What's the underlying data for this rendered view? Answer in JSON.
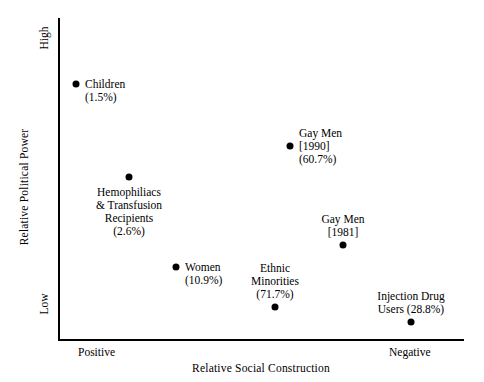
{
  "chart_data": {
    "type": "scatter",
    "title": "",
    "xlabel": "Relative Social Construction",
    "ylabel": "Relative Political Power",
    "x_ticks": [
      "Positive",
      "Negative"
    ],
    "y_ticks": [
      "High",
      "Low"
    ],
    "xlim": [
      "Positive",
      "Negative"
    ],
    "ylim": [
      "Low",
      "High"
    ],
    "grid": false,
    "legend": "none",
    "marker": "filled-circle",
    "marker_color": "#000000",
    "points": [
      {
        "name": "Children",
        "label_lines": [
          "Children",
          "(1.5%)"
        ],
        "percent": "1.5%",
        "x_px": 76,
        "y_px": 84,
        "x_norm": 0.044,
        "y_norm": 0.795,
        "label_align": "left"
      },
      {
        "name": "Hemophiliacs & Transfusion Recipients",
        "label_lines": [
          "Hemophiliacs",
          "& Transfusion",
          "Recipients",
          "(2.6%)"
        ],
        "percent": "2.6%",
        "x_px": 129,
        "y_px": 177,
        "x_norm": 0.175,
        "y_norm": 0.507,
        "label_align": "center"
      },
      {
        "name": "Gay Men [1990]",
        "label_lines": [
          "Gay Men",
          "[1990]",
          "(60.7%)"
        ],
        "percent": "60.7%",
        "year": "1990",
        "x_px": 290,
        "y_px": 146,
        "x_norm": 0.571,
        "y_norm": 0.603,
        "label_align": "left"
      },
      {
        "name": "Gay Men [1981]",
        "label_lines": [
          "Gay Men",
          "[1981]"
        ],
        "year": "1981",
        "x_px": 343,
        "y_px": 245,
        "x_norm": 0.702,
        "y_norm": 0.295,
        "label_align": "center"
      },
      {
        "name": "Women",
        "label_lines": [
          "Women",
          "(10.9%)"
        ],
        "percent": "10.9%",
        "x_px": 176,
        "y_px": 267,
        "x_norm": 0.291,
        "y_norm": 0.227,
        "label_align": "left"
      },
      {
        "name": "Ethnic Minorities",
        "label_lines": [
          "Ethnic",
          "Minorities",
          "(71.7%)"
        ],
        "percent": "71.7%",
        "x_px": 275,
        "y_px": 307,
        "x_norm": 0.535,
        "y_norm": 0.103,
        "label_align": "center"
      },
      {
        "name": "Injection Drug Users",
        "label_lines": [
          "Injection Drug",
          "Users (28.8%)"
        ],
        "percent": "28.8%",
        "x_px": 411,
        "y_px": 322,
        "x_norm": 0.869,
        "y_norm": 0.056,
        "label_align": "center"
      }
    ]
  },
  "axes": {
    "y_title": "Relative Political Power",
    "x_title": "Relative Social Construction",
    "y_high": "High",
    "y_low": "Low",
    "x_positive": "Positive",
    "x_negative": "Negative",
    "line_color": "#000000"
  }
}
